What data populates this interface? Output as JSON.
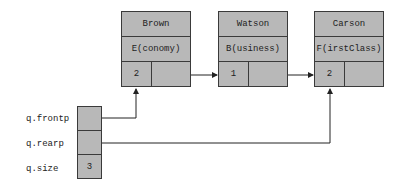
{
  "nodes": [
    {
      "name": "Brown",
      "class_code": "E(conomy)",
      "count": "2",
      "next": "Watson"
    },
    {
      "name": "Watson",
      "class_code": "B(usiness)",
      "count": "1",
      "next": "Carson"
    },
    {
      "name": "Carson",
      "class_code": "F(irstClass)",
      "count": "2",
      "next": null
    }
  ],
  "queue": {
    "frontp_label": "q.frontp",
    "rearp_label": "q.rearp",
    "size_label": "q.size",
    "size_value": "3",
    "frontp_points_to": "Brown",
    "rearp_points_to": "Carson"
  },
  "colors": {
    "box_fill": "#b8b8b8",
    "line": "#222222"
  }
}
